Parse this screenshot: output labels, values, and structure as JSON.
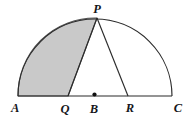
{
  "figure": {
    "type": "geometry-diagram",
    "background_color": "#ffffff",
    "stroke_color": "#2b2b2b",
    "shaded_fill_color": "#c9c9c9",
    "shaded_stroke_color": "#555555",
    "labels": {
      "p": "P",
      "a": "A",
      "q": "Q",
      "b": "B",
      "r": "R",
      "c": "C"
    },
    "geometry": {
      "center": {
        "x": 95,
        "y": 96
      },
      "radius": 77,
      "points": {
        "A": {
          "x": 18,
          "y": 96
        },
        "C": {
          "x": 172,
          "y": 96
        },
        "P": {
          "x": 97,
          "y": 18
        },
        "Q": {
          "x": 68,
          "y": 96
        },
        "B": {
          "x": 95,
          "y": 96
        },
        "R": {
          "x": 128,
          "y": 96
        }
      },
      "segments": [
        {
          "name": "diameter-AC",
          "from": "A",
          "to": "C"
        },
        {
          "name": "segment-PQ",
          "from": "P",
          "to": "Q"
        },
        {
          "name": "segment-PR",
          "from": "P",
          "to": "R"
        }
      ],
      "arcs": [
        {
          "name": "arc-AP",
          "from": "A",
          "to": "P",
          "shaded_boundary": true
        },
        {
          "name": "arc-PC",
          "from": "P",
          "to": "C",
          "shaded_boundary": false
        }
      ],
      "center_dot": {
        "x": 94.5,
        "y": 94.5,
        "r": 2.1
      }
    },
    "label_positions": {
      "p": {
        "x": 97,
        "y": 13,
        "anchor": "middle"
      },
      "a": {
        "x": 11,
        "y": 112,
        "anchor": "start"
      },
      "q": {
        "x": 65,
        "y": 113,
        "anchor": "middle"
      },
      "b": {
        "x": 94,
        "y": 113,
        "anchor": "middle"
      },
      "r": {
        "x": 130,
        "y": 112,
        "anchor": "middle"
      },
      "c": {
        "x": 178,
        "y": 112,
        "anchor": "middle"
      }
    }
  }
}
